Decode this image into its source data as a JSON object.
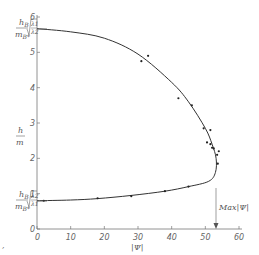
{
  "chart_data": {
    "type": "line",
    "title": "",
    "xlabel": "|Ψ|",
    "ylabel": "h/m",
    "xlim": [
      0,
      60
    ],
    "ylim": [
      0,
      6
    ],
    "x_ticks": [
      "0",
      "10",
      "20",
      "30",
      "40",
      "50",
      "60"
    ],
    "y_ticks": [
      "0",
      "1",
      "2",
      "3",
      "4",
      "5",
      "6"
    ],
    "annotations": [
      {
        "text": "Max|Ψ|",
        "x": 53,
        "y": 1
      },
      {
        "text": "h_B/m_{B*} √(λ1/λ2)",
        "y": 5.67
      },
      {
        "text": "h_B/m_{B*} √(λ2/λ1)",
        "y": 0.8
      }
    ],
    "series": [
      {
        "name": "fitted curve",
        "points": [
          [
            0,
            5.67
          ],
          [
            10,
            5.58
          ],
          [
            20,
            5.4
          ],
          [
            30,
            4.95
          ],
          [
            40,
            4.15
          ],
          [
            45,
            3.6
          ],
          [
            50,
            2.85
          ],
          [
            52,
            2.4
          ],
          [
            53.2,
            2.0
          ],
          [
            53,
            1.6
          ],
          [
            51,
            1.35
          ],
          [
            45,
            1.2
          ],
          [
            38,
            1.07
          ],
          [
            28,
            0.95
          ],
          [
            18,
            0.86
          ],
          [
            10,
            0.82
          ],
          [
            0,
            0.8
          ]
        ]
      },
      {
        "name": "measured points",
        "points": [
          [
            31,
            4.75
          ],
          [
            33,
            4.9
          ],
          [
            42,
            3.7
          ],
          [
            46,
            3.5
          ],
          [
            49.5,
            2.85
          ],
          [
            51.5,
            2.8
          ],
          [
            50.5,
            2.45
          ],
          [
            52,
            2.3
          ],
          [
            52.5,
            2.28
          ],
          [
            54,
            2.2
          ],
          [
            53.5,
            2.1
          ],
          [
            51.5,
            2.4
          ],
          [
            53.7,
            1.85
          ],
          [
            45,
            1.2
          ],
          [
            38,
            1.07
          ],
          [
            28,
            0.93
          ],
          [
            18,
            0.87
          ],
          [
            2,
            0.8
          ]
        ]
      }
    ]
  },
  "labels": {
    "y_main_num": "h",
    "y_main_den": "m",
    "top_num": "h",
    "top_num_sub": "B",
    "top_den": "m",
    "top_den_sub": "B*",
    "top_root_num": "λ",
    "top_root_num_sub": "1",
    "top_root_den": "λ",
    "top_root_den_sub": "2",
    "bot_num": "h",
    "bot_num_sub": "B",
    "bot_den": "m",
    "bot_den_sub": "B*",
    "bot_root_num": "λ",
    "bot_root_num_sub": "2",
    "bot_root_den": "λ",
    "bot_root_den_sub": "1",
    "x_axis": "|Ψ|",
    "max_label": "Max|Ψ|"
  }
}
